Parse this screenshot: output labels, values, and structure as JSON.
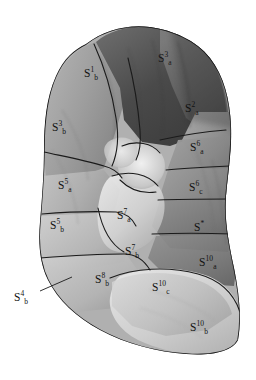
{
  "figure": {
    "caption": "",
    "background_color": "#ffffff",
    "ink_color": "#111111"
  },
  "palette": {
    "darkest": "#3b3b3b",
    "dark": "#595959",
    "mid_dark": "#6e6e6e",
    "mid": "#8a8a8a",
    "mid_light": "#a3a3a3",
    "light": "#bdbdbd",
    "lighter": "#d2d2d2",
    "lightest": "#e6e6e6",
    "outline": "#1a1a1a"
  },
  "labels": [
    {
      "name": "label-s3a",
      "base": "S",
      "sup": "3",
      "sub": "a",
      "x": 158,
      "y": 53,
      "tone": "dark-bg"
    },
    {
      "name": "label-s1b",
      "base": "S",
      "sup": "1",
      "sub": "b",
      "x": 84,
      "y": 68,
      "tone": "light-bg"
    },
    {
      "name": "label-s2a",
      "base": "S",
      "sup": "2",
      "sub": "a",
      "x": 185,
      "y": 103,
      "tone": "light-bg"
    },
    {
      "name": "label-s3b",
      "base": "S",
      "sup": "3",
      "sub": "b",
      "x": 52,
      "y": 122,
      "tone": "light-bg"
    },
    {
      "name": "label-s6a",
      "base": "S",
      "sup": "6",
      "sub": "a",
      "x": 190,
      "y": 142,
      "tone": "light-bg"
    },
    {
      "name": "label-s5a",
      "base": "S",
      "sup": "5",
      "sub": "a",
      "x": 58,
      "y": 180,
      "tone": "light-bg"
    },
    {
      "name": "label-s6c",
      "base": "S",
      "sup": "6",
      "sub": "c",
      "x": 189,
      "y": 182,
      "tone": "light-bg"
    },
    {
      "name": "label-s7a",
      "base": "S",
      "sup": "7",
      "sub": "a",
      "x": 117,
      "y": 210,
      "tone": "light-bg"
    },
    {
      "name": "label-s-star",
      "base": "S",
      "sup": "*",
      "sub": "",
      "x": 194,
      "y": 222,
      "tone": "light-bg"
    },
    {
      "name": "label-s5b",
      "base": "S",
      "sup": "5",
      "sub": "b",
      "x": 50,
      "y": 220,
      "tone": "light-bg"
    },
    {
      "name": "label-s7b",
      "base": "S",
      "sup": "7",
      "sub": "b",
      "x": 125,
      "y": 246,
      "tone": "light-bg"
    },
    {
      "name": "label-s10a",
      "base": "S",
      "sup": "10",
      "sub": "a",
      "x": 199,
      "y": 257,
      "tone": "light-bg"
    },
    {
      "name": "label-s8b",
      "base": "S",
      "sup": "8",
      "sub": "b",
      "x": 95,
      "y": 274,
      "tone": "light-bg"
    },
    {
      "name": "label-s10c",
      "base": "S",
      "sup": "10",
      "sub": "c",
      "x": 152,
      "y": 282,
      "tone": "light-bg"
    },
    {
      "name": "label-s4b",
      "base": "S",
      "sup": "4",
      "sub": "b",
      "x": 14,
      "y": 292,
      "tone": "light-bg"
    },
    {
      "name": "label-s10b",
      "base": "S",
      "sup": "10",
      "sub": "b",
      "x": 190,
      "y": 322,
      "tone": "light-bg"
    }
  ],
  "leader_lines": [
    {
      "name": "leader-line-s4b",
      "x1": 40,
      "y1": 291,
      "x2": 72,
      "y2": 277
    }
  ]
}
